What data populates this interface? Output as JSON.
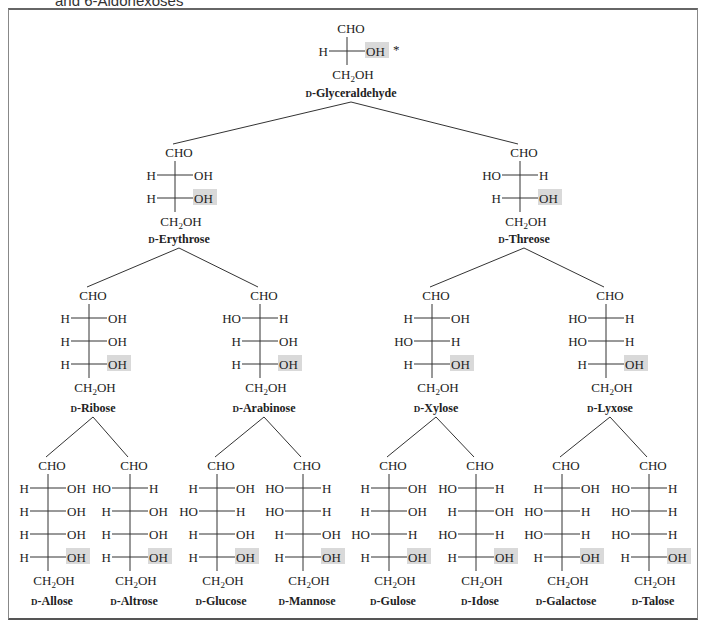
{
  "figure": {
    "title_fragment": "and 6-Aldohexoses",
    "highlight_color": "#d9d9d9",
    "prefix": "D-",
    "chiral_marker": "*",
    "top_group": "CHO",
    "bottom_group": "CH2OH",
    "sugars": [
      {
        "id": "glyceraldehyde",
        "name": "D-Glyceraldehyde",
        "level": 3,
        "x": 347,
        "rows": [
          [
            "H",
            "OH"
          ]
        ],
        "label_y": 97,
        "cho_y": 28,
        "parent": null
      },
      {
        "id": "erythrose",
        "name": "D-Erythrose",
        "level": 4,
        "x": 175,
        "rows": [
          [
            "H",
            "OH"
          ],
          [
            "H",
            "OH"
          ]
        ],
        "label_y": 243,
        "cho_y": 152,
        "parent": "glyceraldehyde"
      },
      {
        "id": "threose",
        "name": "D-Threose",
        "level": 4,
        "x": 520,
        "rows": [
          [
            "HO",
            "H"
          ],
          [
            "H",
            "OH"
          ]
        ],
        "label_y": 243,
        "cho_y": 152,
        "parent": "glyceraldehyde"
      },
      {
        "id": "ribose",
        "name": "D-Ribose",
        "level": 5,
        "x": 89,
        "rows": [
          [
            "H",
            "OH"
          ],
          [
            "H",
            "OH"
          ],
          [
            "H",
            "OH"
          ]
        ],
        "label_y": 412,
        "cho_y": 295,
        "parent": "erythrose"
      },
      {
        "id": "arabinose",
        "name": "D-Arabinose",
        "level": 5,
        "x": 260,
        "rows": [
          [
            "HO",
            "H"
          ],
          [
            "H",
            "OH"
          ],
          [
            "H",
            "OH"
          ]
        ],
        "label_y": 412,
        "cho_y": 295,
        "parent": "erythrose"
      },
      {
        "id": "xylose",
        "name": "D-Xylose",
        "level": 5,
        "x": 432,
        "rows": [
          [
            "H",
            "OH"
          ],
          [
            "HO",
            "H"
          ],
          [
            "H",
            "OH"
          ]
        ],
        "label_y": 412,
        "cho_y": 295,
        "parent": "threose"
      },
      {
        "id": "lyxose",
        "name": "D-Lyxose",
        "level": 5,
        "x": 606,
        "rows": [
          [
            "HO",
            "H"
          ],
          [
            "HO",
            "H"
          ],
          [
            "H",
            "OH"
          ]
        ],
        "label_y": 412,
        "cho_y": 295,
        "parent": "threose"
      },
      {
        "id": "allose",
        "name": "D-Allose",
        "level": 6,
        "x": 48,
        "rows": [
          [
            "H",
            "OH"
          ],
          [
            "H",
            "OH"
          ],
          [
            "H",
            "OH"
          ],
          [
            "H",
            "OH"
          ]
        ],
        "label_y": 605,
        "cho_y": 465,
        "parent": "ribose"
      },
      {
        "id": "altrose",
        "name": "D-Altrose",
        "level": 6,
        "x": 130,
        "rows": [
          [
            "HO",
            "H"
          ],
          [
            "H",
            "OH"
          ],
          [
            "H",
            "OH"
          ],
          [
            "H",
            "OH"
          ]
        ],
        "label_y": 605,
        "cho_y": 465,
        "parent": "ribose"
      },
      {
        "id": "glucose",
        "name": "D-Glucose",
        "level": 6,
        "x": 217,
        "rows": [
          [
            "H",
            "OH"
          ],
          [
            "HO",
            "H"
          ],
          [
            "H",
            "OH"
          ],
          [
            "H",
            "OH"
          ]
        ],
        "label_y": 605,
        "cho_y": 465,
        "parent": "arabinose"
      },
      {
        "id": "mannose",
        "name": "D-Mannose",
        "level": 6,
        "x": 303,
        "rows": [
          [
            "HO",
            "H"
          ],
          [
            "HO",
            "H"
          ],
          [
            "H",
            "OH"
          ],
          [
            "H",
            "OH"
          ]
        ],
        "label_y": 605,
        "cho_y": 465,
        "parent": "arabinose"
      },
      {
        "id": "gulose",
        "name": "D-Gulose",
        "level": 6,
        "x": 389,
        "rows": [
          [
            "H",
            "OH"
          ],
          [
            "H",
            "OH"
          ],
          [
            "HO",
            "H"
          ],
          [
            "H",
            "OH"
          ]
        ],
        "label_y": 605,
        "cho_y": 465,
        "parent": "xylose"
      },
      {
        "id": "idose",
        "name": "D-Idose",
        "level": 6,
        "x": 476,
        "rows": [
          [
            "HO",
            "H"
          ],
          [
            "H",
            "OH"
          ],
          [
            "HO",
            "H"
          ],
          [
            "H",
            "OH"
          ]
        ],
        "label_y": 605,
        "cho_y": 465,
        "parent": "xylose"
      },
      {
        "id": "galactose",
        "name": "D-Galactose",
        "level": 6,
        "x": 562,
        "rows": [
          [
            "H",
            "OH"
          ],
          [
            "HO",
            "H"
          ],
          [
            "HO",
            "H"
          ],
          [
            "H",
            "OH"
          ]
        ],
        "label_y": 605,
        "cho_y": 465,
        "parent": "lyxose"
      },
      {
        "id": "talose",
        "name": "D-Talose",
        "level": 6,
        "x": 649,
        "rows": [
          [
            "HO",
            "H"
          ],
          [
            "HO",
            "H"
          ],
          [
            "HO",
            "H"
          ],
          [
            "H",
            "OH"
          ]
        ],
        "label_y": 605,
        "cho_y": 465,
        "parent": "lyxose"
      }
    ]
  }
}
